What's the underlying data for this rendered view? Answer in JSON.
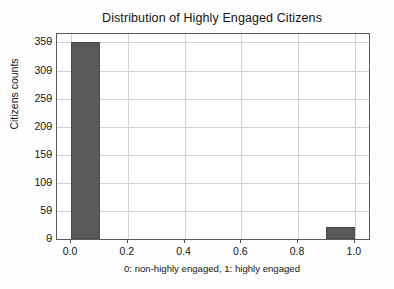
{
  "chart_data": {
    "type": "bar",
    "title": "Distribution of Highly Engaged Citizens",
    "subtitle": "",
    "xlabel": "0: non-highly engaged, 1: highly engaged",
    "ylabel": "Citizens counts",
    "xlim": [
      -0.05,
      1.05
    ],
    "ylim": [
      0,
      365
    ],
    "grid": true,
    "legend": null,
    "bar_color": "#595959",
    "x_tick_labels": [
      "0.0",
      "0.2",
      "0.4",
      "0.6",
      "0.8",
      "1.0"
    ],
    "x_tick_values": [
      0.0,
      0.2,
      0.4,
      0.6,
      0.8,
      1.0
    ],
    "y_tick_labels": [
      "0",
      "50",
      "100",
      "150",
      "200",
      "250",
      "300",
      "350"
    ],
    "y_tick_values": [
      0,
      50,
      100,
      150,
      200,
      250,
      300,
      350
    ],
    "categories": [
      "0",
      "1"
    ],
    "values": [
      350,
      21
    ],
    "bins": [
      {
        "label": "0",
        "x_start": 0.0,
        "x_end": 0.1,
        "value": 350
      },
      {
        "label": "1",
        "x_start": 0.9,
        "x_end": 1.0,
        "value": 21
      }
    ]
  },
  "figure": {
    "background_color": "#fefefe",
    "axes_background_color": "#ffffff",
    "spine_color": "#5a5a5a",
    "grid_color": "#d2d2d2",
    "text_color": "#141414"
  }
}
